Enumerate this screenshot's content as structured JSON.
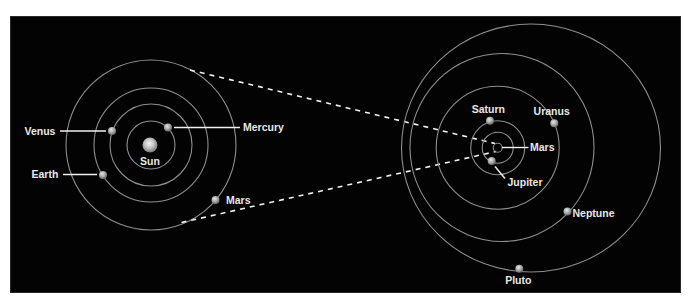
{
  "diagram": {
    "type": "solar-system-comparison",
    "colors": {
      "background": "#030303",
      "orbit": "#8e8e8e",
      "label": "#e8e8e8",
      "planet": "#b8b8b8",
      "page": "#ffffff"
    },
    "inner_system": {
      "center_label": "Sun",
      "planets": [
        {
          "name": "Mercury",
          "label": "Mercury"
        },
        {
          "name": "Venus",
          "label": "Venus"
        },
        {
          "name": "Earth",
          "label": "Earth"
        },
        {
          "name": "Mars",
          "label": "Mars"
        }
      ]
    },
    "outer_system": {
      "planets": [
        {
          "name": "Mars",
          "label": "Mars"
        },
        {
          "name": "Jupiter",
          "label": "Jupiter"
        },
        {
          "name": "Saturn",
          "label": "Saturn"
        },
        {
          "name": "Uranus",
          "label": "Uranus"
        },
        {
          "name": "Neptune",
          "label": "Neptune"
        },
        {
          "name": "Pluto",
          "label": "Pluto"
        }
      ]
    },
    "connector": "dashed zoom lines from inner system outer orbit to outer system's inner orbits"
  }
}
